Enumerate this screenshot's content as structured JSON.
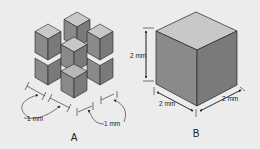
{
  "figure_a": {
    "caption": "A",
    "dimension_left": "1 mm",
    "dimension_right": "1 mm",
    "description": "eight 1 mm cubes separated by gaps forming a 2x2x2 arrangement"
  },
  "figure_b": {
    "caption": "B",
    "dimension_height": "2 mm",
    "dimension_left_edge": "2 mm",
    "dimension_right_edge": "2 mm",
    "description": "single 2 mm cube"
  },
  "colors": {
    "background": "#ececec",
    "top_face": "#c8c8c8",
    "left_face": "#8a8a8a",
    "right_face": "#7a7a7a",
    "outline": "#222222"
  }
}
